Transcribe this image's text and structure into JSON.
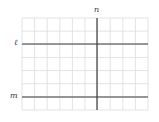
{
  "diagram": {
    "type": "grid-with-lines",
    "grid": {
      "left": 22,
      "top": 18,
      "right": 148,
      "bottom": 110,
      "columns": 10,
      "rows": 7,
      "color": "#dcdcdc"
    },
    "lines": [
      {
        "id": "l",
        "label": "ℓ",
        "orientation": "horizontal",
        "y": 44,
        "x1": 22,
        "x2": 148,
        "color": "#3a3a3a",
        "width": 1.2
      },
      {
        "id": "m",
        "label": "m",
        "orientation": "horizontal",
        "y": 97,
        "x1": 22,
        "x2": 148,
        "color": "#777777",
        "width": 1.6
      },
      {
        "id": "n",
        "label": "n",
        "orientation": "vertical",
        "x": 97,
        "y1": 18,
        "y2": 110,
        "color": "#3a3a3a",
        "width": 1.2
      }
    ],
    "labels": {
      "l": "ℓ",
      "m": "m",
      "n": "n"
    }
  }
}
